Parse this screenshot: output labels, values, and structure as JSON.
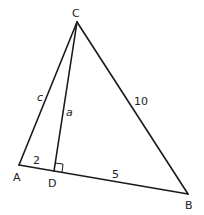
{
  "diagram": {
    "type": "triangle-with-altitude",
    "vertices": {
      "A": {
        "label": "A",
        "x": 19,
        "y": 165
      },
      "B": {
        "label": "B",
        "x": 188,
        "y": 194
      },
      "C": {
        "label": "C",
        "x": 77,
        "y": 22
      },
      "D": {
        "label": "D",
        "x": 54,
        "y": 171
      }
    },
    "segments": [
      {
        "from": "A",
        "to": "C",
        "label": "c"
      },
      {
        "from": "C",
        "to": "B",
        "label": "10"
      },
      {
        "from": "A",
        "to": "B",
        "label": ""
      },
      {
        "from": "C",
        "to": "D",
        "label": "a"
      }
    ],
    "side_labels": {
      "AD": "2",
      "DB": "5",
      "CB": "10",
      "AC": "c",
      "CD": "a"
    },
    "right_angle_at": "D"
  }
}
